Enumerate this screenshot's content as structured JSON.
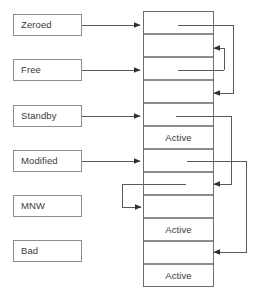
{
  "diagram": {
    "colors": {
      "box_border": "#8c8c8c",
      "stack_border": "#6e6e6e",
      "connector": "#5a5a5a",
      "text": "#3b3b3b",
      "background": "#ffffff"
    },
    "state_labels": [
      {
        "id": "zeroed",
        "label": "Zeroed"
      },
      {
        "id": "free",
        "label": "Free"
      },
      {
        "id": "standby",
        "label": "Standby"
      },
      {
        "id": "modified",
        "label": "Modified"
      },
      {
        "id": "mnw",
        "label": "MNW"
      },
      {
        "id": "bad",
        "label": "Bad"
      }
    ],
    "page_frames": [
      {
        "index": 1,
        "label": ""
      },
      {
        "index": 2,
        "label": ""
      },
      {
        "index": 3,
        "label": ""
      },
      {
        "index": 4,
        "label": ""
      },
      {
        "index": 5,
        "label": ""
      },
      {
        "index": 6,
        "label": "Active"
      },
      {
        "index": 7,
        "label": ""
      },
      {
        "index": 8,
        "label": ""
      },
      {
        "index": 9,
        "label": ""
      },
      {
        "index": 10,
        "label": "Active"
      },
      {
        "index": 11,
        "label": ""
      },
      {
        "index": 12,
        "label": "Active"
      }
    ],
    "connectors": [
      {
        "id": "zeroed-to-frame1",
        "from": "zeroed",
        "to": "frame-1",
        "direction": "right"
      },
      {
        "id": "free-to-frame3",
        "from": "free",
        "to": "frame-3",
        "direction": "right"
      },
      {
        "id": "standby-to-frame5",
        "from": "standby",
        "to": "frame-5",
        "direction": "right"
      },
      {
        "id": "modified-to-frame7",
        "from": "modified",
        "to": "frame-7",
        "direction": "right"
      },
      {
        "id": "loopback-frame1-to-frame4",
        "from": "frame-1",
        "to": "frame-4",
        "direction": "left"
      },
      {
        "id": "loopback-frame3-to-frame2",
        "from": "frame-3",
        "to": "frame-2",
        "direction": "left"
      },
      {
        "id": "loopback-frame5-to-frame8",
        "from": "frame-5",
        "to": "frame-8",
        "direction": "left"
      },
      {
        "id": "loopback-frame7-to-frame11",
        "from": "frame-7",
        "to": "frame-11",
        "direction": "left"
      },
      {
        "id": "loopback-frame8-to-frame9",
        "from": "frame-8",
        "to": "frame-9",
        "direction": "right"
      }
    ]
  }
}
